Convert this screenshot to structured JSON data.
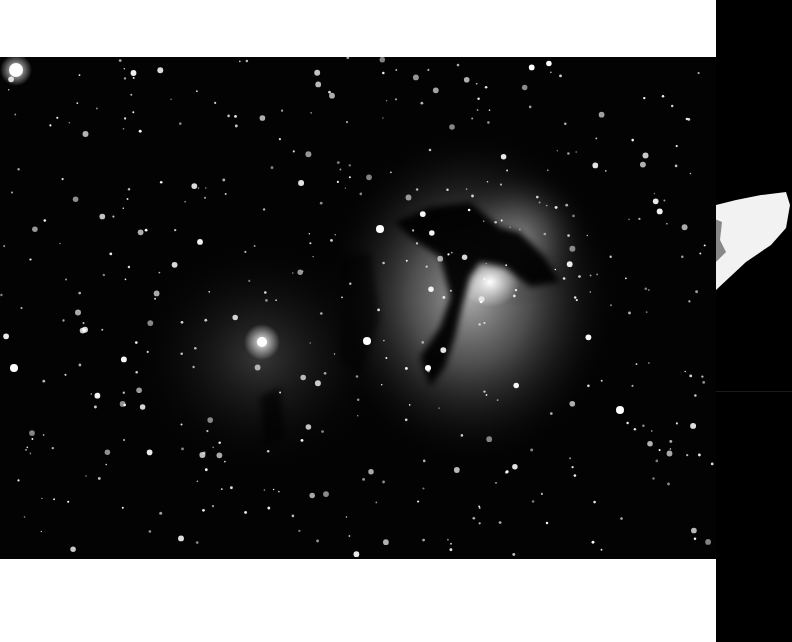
{
  "image": {
    "subject": "Trifid Nebula (M20) astrophotograph, black and white",
    "background_color": "#ffffff",
    "photo_background": "#000000",
    "right_strip_color": "#000000"
  }
}
